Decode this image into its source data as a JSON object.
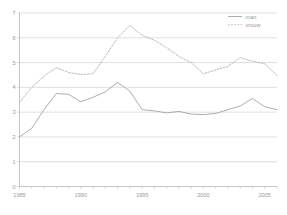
{
  "chart_data": {
    "type": "line",
    "title": "",
    "subtitle": "",
    "xlabel": "",
    "ylabel": "",
    "xlim": [
      1985,
      2006
    ],
    "ylim": [
      0,
      7
    ],
    "grid": true,
    "legend_position": "top-right",
    "y_ticks": [
      "0",
      "1",
      "2",
      "3",
      "4",
      "5",
      "6",
      "7"
    ],
    "y_tick_values": [
      0,
      1,
      2,
      3,
      4,
      5,
      6,
      7
    ],
    "x_ticks_labeled": [
      "1985",
      "1990",
      "1995",
      "2000",
      "2005"
    ],
    "x_tick_values_labeled": [
      1985,
      1990,
      1995,
      2000,
      2005
    ],
    "x_minor_ticks": [
      1985,
      1986,
      1987,
      1988,
      1989,
      1990,
      1991,
      1992,
      1993,
      1994,
      1995,
      1996,
      1997,
      1998,
      1999,
      2000,
      2001,
      2002,
      2003,
      2004,
      2005,
      2006
    ],
    "x": [
      1985,
      1986,
      1987,
      1988,
      1989,
      1990,
      1991,
      1992,
      1993,
      1994,
      1995,
      1996,
      1997,
      1998,
      1999,
      2000,
      2001,
      2002,
      2003,
      2004,
      2005,
      2006
    ],
    "series": [
      {
        "name": "man",
        "style": "solid",
        "color": "#9e9e9e",
        "values": [
          2.0,
          2.35,
          3.1,
          3.75,
          3.72,
          3.42,
          3.6,
          3.82,
          4.2,
          3.85,
          3.1,
          3.05,
          2.97,
          3.03,
          2.92,
          2.9,
          2.95,
          3.1,
          3.25,
          3.55,
          3.22,
          3.1
        ]
      },
      {
        "name": "vrouw",
        "style": "dotted",
        "color": "#b4b4b4",
        "values": [
          3.4,
          4.0,
          4.45,
          4.8,
          4.6,
          4.52,
          4.55,
          5.25,
          6.0,
          6.5,
          6.1,
          5.9,
          5.6,
          5.25,
          5.0,
          4.55,
          4.7,
          4.85,
          5.2,
          5.05,
          4.95,
          4.48
        ]
      }
    ]
  },
  "legend": {
    "entries": [
      {
        "label": "man"
      },
      {
        "label": "vrouw"
      }
    ]
  }
}
